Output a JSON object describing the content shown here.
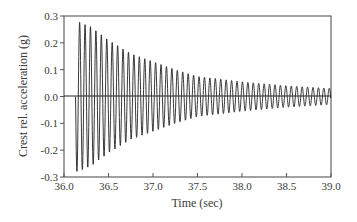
{
  "chart_data": {
    "type": "line",
    "title": "",
    "xlabel": "Time (sec)",
    "ylabel": "Crest rel. acceleration (g)",
    "xlim": [
      36.0,
      39.0
    ],
    "ylim": [
      -0.3,
      0.3
    ],
    "grid": false,
    "legend": null,
    "xticks": [
      36.0,
      36.5,
      37.0,
      37.5,
      38.0,
      38.5,
      39.0
    ],
    "xtick_labels": [
      "36.0",
      "36.5",
      "37.0",
      "37.5",
      "38.0",
      "38.5",
      "39.0"
    ],
    "yticks": [
      0.3,
      0.2,
      0.1,
      0.0,
      -0.1,
      -0.2,
      -0.3
    ],
    "ytick_labels": [
      "0.3",
      "0.2",
      "0.1",
      "0.0",
      "-0.1",
      "-0.2",
      "-0.3"
    ],
    "zero_line": true,
    "series": [
      {
        "name": "Crest relative acceleration",
        "description": "Decaying sinusoidal free vibration, ~16 Hz, starting at ~36.13 s",
        "signal_start": 36.13,
        "frequency_hz": 16.4,
        "envelope": {
          "t": [
            36.15,
            36.3,
            36.5,
            36.75,
            37.0,
            37.25,
            37.5,
            38.0,
            38.5,
            39.0
          ],
          "amplitude": [
            0.28,
            0.26,
            0.21,
            0.16,
            0.13,
            0.1,
            0.075,
            0.055,
            0.04,
            0.03
          ]
        },
        "peaks_early": [
          0.28,
          0.27,
          0.26,
          0.24,
          0.24,
          0.21,
          0.2,
          0.19
        ],
        "troughs_early": [
          -0.28,
          -0.27,
          -0.27,
          -0.23,
          -0.22,
          -0.22,
          -0.19
        ]
      }
    ]
  }
}
